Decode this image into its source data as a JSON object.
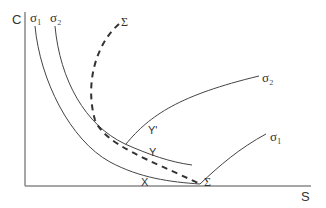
{
  "diagram": {
    "axes": {
      "y_label": "C",
      "x_label": "S"
    },
    "curves": {
      "sigma1_label_left": "σ₁",
      "sigma2_label_left": "σ₂",
      "sigma_label_top": "Σ",
      "sigma2_label_right": "σ₂",
      "sigma1_label_right": "σ₁",
      "sigma_label_bottom": "Σ"
    },
    "points": {
      "y_prime": "Y'",
      "y": "Y",
      "x": "X"
    },
    "colors": {
      "line": "#444444",
      "axis": "#888888",
      "background": "#ffffff"
    }
  }
}
